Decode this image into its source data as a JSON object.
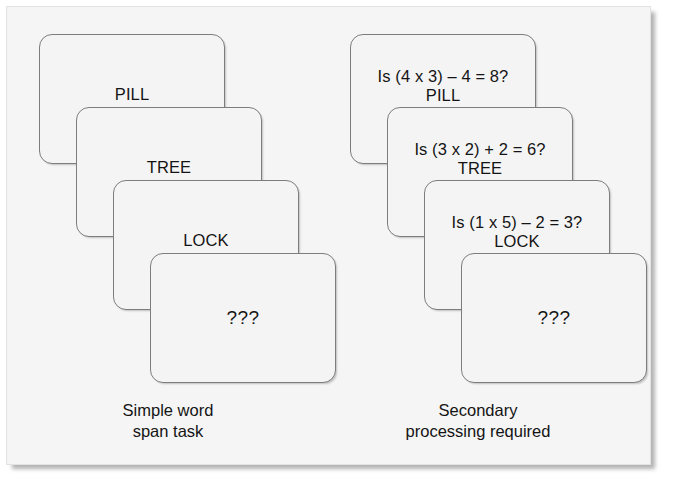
{
  "figure": {
    "background_color": "#f5f5f5",
    "card_border_color": "#7d7d7d",
    "text_color": "#141414"
  },
  "panels": [
    {
      "id": "simple-word-span",
      "caption_line1": "Simple word",
      "caption_line2": "span task",
      "cards": [
        {
          "equation": "",
          "word": "PILL"
        },
        {
          "equation": "",
          "word": "TREE"
        },
        {
          "equation": "",
          "word": "LOCK"
        },
        {
          "equation": "",
          "word": "???"
        }
      ]
    },
    {
      "id": "complex-span",
      "caption_line1": "Secondary",
      "caption_line2": "processing required",
      "cards": [
        {
          "equation": "Is (4 x 3) – 4 = 8?",
          "word": "PILL"
        },
        {
          "equation": "Is (3 x 2) + 2 = 6?",
          "word": "TREE"
        },
        {
          "equation": "Is (1 x 5) – 2 = 3?",
          "word": "LOCK"
        },
        {
          "equation": "",
          "word": "???"
        }
      ]
    }
  ]
}
